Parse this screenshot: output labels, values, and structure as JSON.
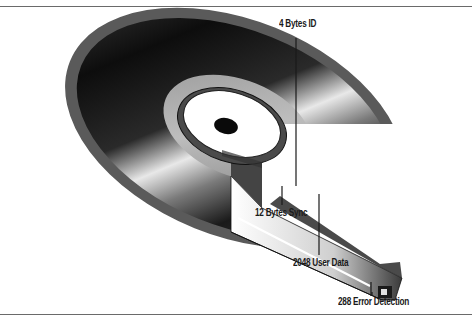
{
  "diagram": {
    "type": "cd-rom-sector-structure",
    "labels": [
      {
        "id": "id",
        "text": "4 Bytes ID"
      },
      {
        "id": "sync",
        "text": "12 Bytes Sync"
      },
      {
        "id": "user_data",
        "text": "2048 User Data"
      },
      {
        "id": "error_detection",
        "text": "288 Error Detection"
      }
    ],
    "colors": {
      "rule": "#6a6a6a",
      "disc_dark": "#111111",
      "disc_rim": "#555555",
      "hub_white": "#ffffff",
      "leader_line": "#1a1a1a"
    }
  }
}
